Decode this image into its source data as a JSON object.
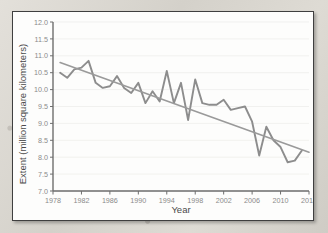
{
  "chart_data": {
    "type": "line",
    "title": "",
    "xlabel": "Year",
    "ylabel": "Extent (million square kilometers)",
    "xlim": [
      1978,
      2014
    ],
    "ylim": [
      7.0,
      12.0
    ],
    "grid": true,
    "legend": "none",
    "x_ticks": [
      "1978",
      "1982",
      "1986",
      "1990",
      "1994",
      "1998",
      "2002",
      "2006",
      "2010",
      "2014"
    ],
    "x_tick_values": [
      1978,
      1982,
      1986,
      1990,
      1994,
      1998,
      2002,
      2006,
      2010,
      2014
    ],
    "y_ticks": [
      "7.0",
      "7.5",
      "8.0",
      "8.5",
      "9.0",
      "9.5",
      "10.0",
      "10.5",
      "11.0",
      "11.5",
      "12.0"
    ],
    "y_tick_values": [
      7.0,
      7.5,
      8.0,
      8.5,
      9.0,
      9.5,
      10.0,
      10.5,
      11.0,
      11.5,
      12.0
    ],
    "series": [
      {
        "name": "Sea ice extent",
        "type": "line",
        "color": "#8d8d8d",
        "x": [
          1979,
          1980,
          1981,
          1982,
          1983,
          1984,
          1985,
          1986,
          1987,
          1988,
          1989,
          1990,
          1991,
          1992,
          1993,
          1994,
          1995,
          1996,
          1997,
          1998,
          1999,
          2000,
          2001,
          2002,
          2003,
          2004,
          2005,
          2006,
          2007,
          2008,
          2009,
          2010,
          2011,
          2012,
          2013
        ],
        "values": [
          10.5,
          10.35,
          10.6,
          10.65,
          10.85,
          10.2,
          10.05,
          10.1,
          10.4,
          10.05,
          9.9,
          10.2,
          9.6,
          9.95,
          9.65,
          10.55,
          9.6,
          10.2,
          9.1,
          10.3,
          9.6,
          9.55,
          9.55,
          9.7,
          9.4,
          9.45,
          9.5,
          9.05,
          8.05,
          8.9,
          8.5,
          8.3,
          7.85,
          7.9,
          8.2
        ]
      },
      {
        "name": "Linear trend",
        "type": "line",
        "color": "#9a9a9a",
        "x": [
          1979,
          2014
        ],
        "values": [
          10.8,
          8.15
        ]
      }
    ]
  }
}
